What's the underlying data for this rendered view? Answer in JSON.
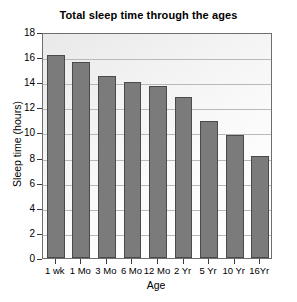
{
  "chart_data": {
    "type": "bar",
    "title": "Total sleep time through the ages",
    "xlabel": "Age",
    "ylabel": "Sleep time (hours)",
    "categories": [
      "1 wk",
      "1 Mo",
      "3 Mo",
      "6 Mo",
      "12 Mo",
      "2 Yr",
      "5 Yr",
      "10 Yr",
      "16Yr"
    ],
    "values": [
      16.2,
      15.6,
      14.5,
      14.0,
      13.7,
      12.8,
      10.9,
      9.8,
      8.1
    ],
    "ylim": [
      0,
      18
    ],
    "yticks": [
      0,
      2,
      4,
      6,
      8,
      10,
      12,
      14,
      16,
      18
    ],
    "ytick_labels": [
      "0",
      "2",
      "4",
      "6",
      "8",
      "10",
      "12",
      "14",
      "16",
      "18"
    ],
    "grid": true,
    "legend": false,
    "bar_color": "#7b7b7b",
    "bar_edge_color": "#4a4a4a",
    "grid_color": "#b9b9b9",
    "axis_color": "#6e6e6e",
    "plot_background": "#f4f4f4"
  }
}
